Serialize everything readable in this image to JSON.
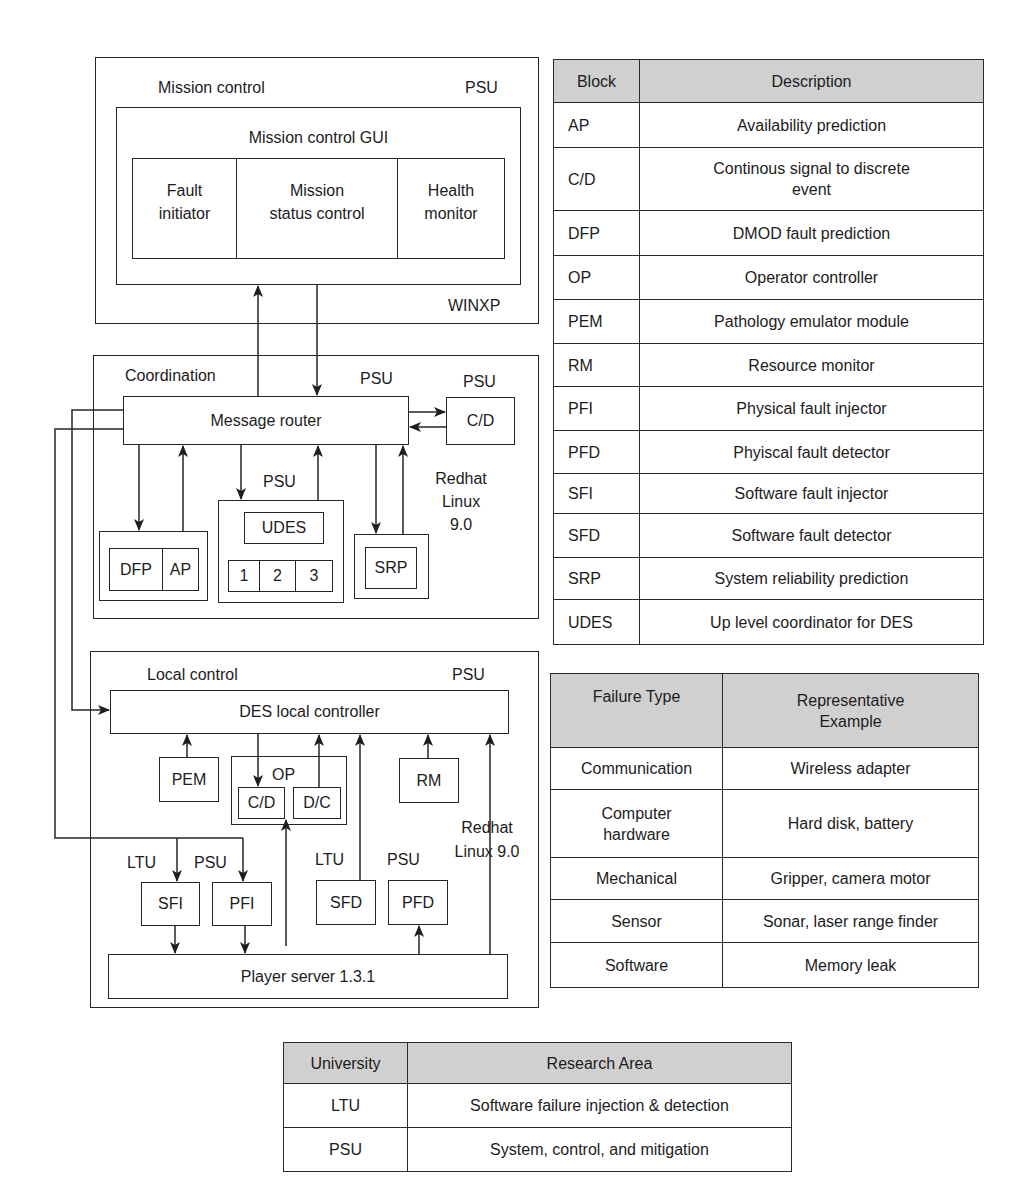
{
  "diagram": {
    "mission_control": {
      "title": "Mission control",
      "org": "PSU",
      "os": "WINXP",
      "gui_title": "Mission control GUI",
      "modules": [
        "Fault\ninitiator",
        "Mission\nstatus control",
        "Health\nmonitor"
      ]
    },
    "coordination": {
      "title": "Coordination",
      "org": "PSU",
      "router": "Message router",
      "cd": {
        "org": "PSU",
        "label": "C/D"
      },
      "dfp_ap": [
        "DFP",
        "AP"
      ],
      "udes": {
        "org": "PSU",
        "label": "UDES",
        "slots": [
          "1",
          "2",
          "3"
        ]
      },
      "srp": "SRP",
      "os": "Redhat\nLinux 9.0"
    },
    "local_control": {
      "title": "Local control",
      "org": "PSU",
      "controller": "DES local controller",
      "pem": "PEM",
      "op": {
        "label": "OP",
        "cd": "C/D",
        "dc": "D/C"
      },
      "rm": "RM",
      "os": "Redhat\nLinux 9.0",
      "sfi": {
        "org": "LTU",
        "label": "SFI"
      },
      "pfi": {
        "org": "PSU",
        "label": "PFI"
      },
      "sfd": {
        "org": "LTU",
        "label": "SFD"
      },
      "pfd": {
        "org": "PSU",
        "label": "PFD"
      },
      "player": "Player server 1.3.1"
    }
  },
  "tables": {
    "blocks": {
      "headers": [
        "Block",
        "Description"
      ],
      "rows": [
        {
          "block": "AP",
          "description": "Availability prediction"
        },
        {
          "block": "C/D",
          "description": "Continous signal to discrete\nevent"
        },
        {
          "block": "DFP",
          "description": "DMOD fault prediction"
        },
        {
          "block": "OP",
          "description": "Operator controller"
        },
        {
          "block": "PEM",
          "description": "Pathology emulator module"
        },
        {
          "block": "RM",
          "description": "Resource monitor"
        },
        {
          "block": "PFI",
          "description": "Physical fault injector"
        },
        {
          "block": "PFD",
          "description": "Phyiscal fault detector"
        },
        {
          "block": "SFI",
          "description": "Software fault injector"
        },
        {
          "block": "SFD",
          "description": "Software fault detector"
        },
        {
          "block": "SRP",
          "description": "System reliability prediction"
        },
        {
          "block": "UDES",
          "description": "Up level coordinator for DES"
        }
      ]
    },
    "failures": {
      "headers": [
        "Failure Type",
        "Representative\nExample"
      ],
      "rows": [
        {
          "type": "Communication",
          "example": "Wireless adapter"
        },
        {
          "type": "Computer\nhardware",
          "example": "Hard disk, battery"
        },
        {
          "type": "Mechanical",
          "example": "Gripper, camera motor"
        },
        {
          "type": "Sensor",
          "example": "Sonar, laser range finder"
        },
        {
          "type": "Software",
          "example": "Memory leak"
        }
      ]
    },
    "universities": {
      "headers": [
        "University",
        "Research Area"
      ],
      "rows": [
        {
          "university": "LTU",
          "area": "Software failure injection & detection"
        },
        {
          "university": "PSU",
          "area": "System, control, and mitigation"
        }
      ]
    }
  }
}
